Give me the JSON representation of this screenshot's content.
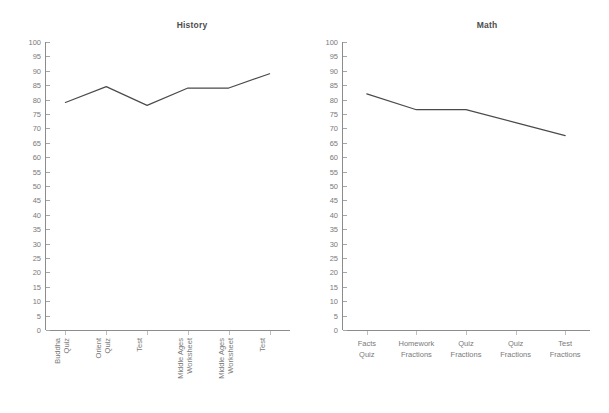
{
  "page": {
    "background_color": "#ffffff",
    "width": 609,
    "height": 413
  },
  "charts": {
    "history": {
      "title": "History",
      "y_ticks": [
        "100",
        "95",
        "90",
        "85",
        "80",
        "75",
        "70",
        "65",
        "60",
        "55",
        "50",
        "45",
        "40",
        "35",
        "30",
        "25",
        "20",
        "15",
        "10",
        "5",
        "0"
      ],
      "x_labels": [
        "Buddha Quiz",
        "Orient Quiz",
        "Test",
        "Middle Ages Worksheet",
        "Middle Ages Worksheet",
        "Test"
      ]
    },
    "math": {
      "title": "Math",
      "y_ticks": [
        "100",
        "95",
        "90",
        "85",
        "80",
        "75",
        "70",
        "65",
        "60",
        "55",
        "50",
        "45",
        "40",
        "35",
        "30",
        "25",
        "20",
        "15",
        "10",
        "5",
        "0"
      ],
      "x_labels": [
        "Facts Quiz",
        "Homework Fractions",
        "Quiz Fractions",
        "Quiz Fractions",
        "Test Fractions"
      ],
      "x_labels_lines": [
        [
          "Facts",
          "Quiz"
        ],
        [
          "Homework",
          "Fractions"
        ],
        [
          "Quiz",
          "Fractions"
        ],
        [
          "Quiz",
          "Fractions"
        ],
        [
          "Test",
          "Fractions"
        ]
      ]
    }
  },
  "chart_data": [
    {
      "type": "line",
      "title": "History",
      "xlabel": "",
      "ylabel": "",
      "ylim": [
        0,
        100
      ],
      "ytick_step": 5,
      "grid": false,
      "legend": "none",
      "line_color": "#4a4a4a",
      "categories": [
        "Buddha Quiz",
        "Orient Quiz",
        "Test",
        "Middle Ages Worksheet",
        "Middle Ages Worksheet",
        "Test"
      ],
      "values": [
        79,
        84.5,
        78,
        84,
        84,
        89
      ]
    },
    {
      "type": "line",
      "title": "Math",
      "xlabel": "",
      "ylabel": "",
      "ylim": [
        0,
        100
      ],
      "ytick_step": 5,
      "grid": false,
      "legend": "none",
      "line_color": "#4a4a4a",
      "categories": [
        "Facts Quiz",
        "Homework Fractions",
        "Quiz Fractions",
        "Quiz Fractions",
        "Test Fractions"
      ],
      "values": [
        82,
        76.5,
        76.5,
        72,
        67.5
      ]
    }
  ]
}
